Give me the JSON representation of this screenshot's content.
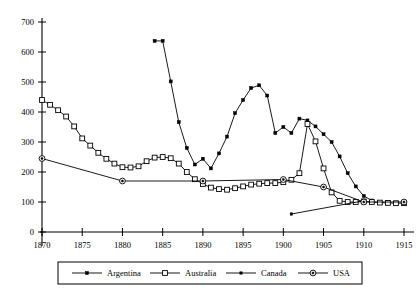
{
  "chart_data": {
    "type": "line",
    "title": "",
    "subtitle": "",
    "xlabel": "",
    "ylabel": "",
    "xlim": [
      1870,
      1915
    ],
    "ylim": [
      0,
      700
    ],
    "grid": false,
    "legend_position": "bottom",
    "x_ticks": [
      "1870",
      "1875",
      "1880",
      "1885",
      "1890",
      "1895",
      "1900",
      "1905",
      "1910",
      "1915"
    ],
    "x_tick_values": [
      1870,
      1875,
      1880,
      1885,
      1890,
      1895,
      1900,
      1905,
      1910,
      1915
    ],
    "y_ticks": [
      "0",
      "100",
      "200",
      "300",
      "400",
      "500",
      "600",
      "700"
    ],
    "y_tick_values": [
      0,
      100,
      200,
      300,
      400,
      500,
      600,
      700
    ],
    "series": [
      {
        "name": "Argentina",
        "marker": "filled-square",
        "color": "#000000",
        "points": [
          [
            1884,
            637
          ],
          [
            1885,
            637
          ],
          [
            1886,
            502
          ],
          [
            1887,
            366
          ],
          [
            1888,
            280
          ],
          [
            1889,
            225
          ],
          [
            1890,
            244
          ],
          [
            1891,
            212
          ],
          [
            1892,
            262
          ],
          [
            1893,
            318
          ],
          [
            1894,
            396
          ],
          [
            1895,
            440
          ],
          [
            1896,
            480
          ],
          [
            1897,
            489
          ],
          [
            1898,
            455
          ],
          [
            1899,
            330
          ],
          [
            1900,
            350
          ],
          [
            1901,
            330
          ],
          [
            1902,
            378
          ],
          [
            1903,
            372
          ],
          [
            1904,
            352
          ],
          [
            1905,
            326
          ],
          [
            1906,
            300
          ],
          [
            1907,
            252
          ],
          [
            1908,
            196
          ],
          [
            1909,
            152
          ],
          [
            1910,
            120
          ],
          [
            1911,
            105
          ]
        ]
      },
      {
        "name": "Australia",
        "marker": "open-square",
        "color": "#000000",
        "points": [
          [
            1870,
            440
          ],
          [
            1871,
            424
          ],
          [
            1872,
            406
          ],
          [
            1873,
            385
          ],
          [
            1874,
            352
          ],
          [
            1875,
            312
          ],
          [
            1876,
            288
          ],
          [
            1877,
            264
          ],
          [
            1878,
            244
          ],
          [
            1879,
            228
          ],
          [
            1880,
            216
          ],
          [
            1881,
            215
          ],
          [
            1882,
            219
          ],
          [
            1883,
            236
          ],
          [
            1884,
            248
          ],
          [
            1885,
            250
          ],
          [
            1886,
            246
          ],
          [
            1887,
            228
          ],
          [
            1888,
            200
          ],
          [
            1889,
            176
          ],
          [
            1890,
            160
          ],
          [
            1891,
            148
          ],
          [
            1892,
            143
          ],
          [
            1893,
            141
          ],
          [
            1894,
            146
          ],
          [
            1895,
            152
          ],
          [
            1896,
            158
          ],
          [
            1897,
            161
          ],
          [
            1898,
            163
          ],
          [
            1899,
            163
          ],
          [
            1900,
            166
          ],
          [
            1901,
            174
          ],
          [
            1902,
            196
          ],
          [
            1903,
            360
          ],
          [
            1904,
            302
          ],
          [
            1905,
            212
          ],
          [
            1906,
            132
          ],
          [
            1907,
            104
          ],
          [
            1908,
            100
          ],
          [
            1909,
            100
          ],
          [
            1910,
            102
          ],
          [
            1911,
            100
          ],
          [
            1912,
            98
          ],
          [
            1913,
            97
          ],
          [
            1914,
            96
          ],
          [
            1915,
            96
          ]
        ]
      },
      {
        "name": "Canada",
        "marker": "small-dot",
        "color": "#000000",
        "points": [
          [
            1901,
            60
          ],
          [
            1910,
            104
          ]
        ]
      },
      {
        "name": "USA",
        "marker": "circle-dot",
        "color": "#000000",
        "points": [
          [
            1870,
            245
          ],
          [
            1880,
            170
          ],
          [
            1890,
            170
          ],
          [
            1900,
            175
          ],
          [
            1905,
            150
          ],
          [
            1910,
            100
          ],
          [
            1915,
            100
          ]
        ]
      }
    ]
  }
}
